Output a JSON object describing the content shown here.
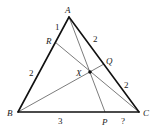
{
  "diagram": {
    "points": {
      "A": "A",
      "B": "B",
      "C": "C",
      "R": "R",
      "Q": "Q",
      "P": "P",
      "X": "X"
    },
    "segment_lengths": {
      "AR": "1",
      "RB": "2",
      "AQ": "2",
      "QC": "2",
      "BP": "3",
      "PC": "?"
    },
    "colors": {
      "sides": "#111111",
      "cevians": "#444444",
      "text": "#222222"
    }
  }
}
